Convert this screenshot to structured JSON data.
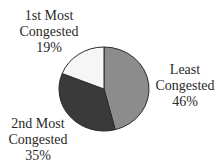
{
  "chart_data": {
    "type": "pie",
    "title": "",
    "categories": [
      "Least Congested",
      "2nd Most Congested",
      "1st Most Congested"
    ],
    "values": [
      46,
      35,
      19
    ],
    "unit": "%",
    "colors": [
      "#8c8c8c",
      "#3a3a3a",
      "#f6f6f6"
    ],
    "labels": [
      {
        "line1": "Least",
        "line2": "Congested",
        "value": "46%"
      },
      {
        "line1": "2nd Most",
        "line2": "Congested",
        "value": "35%"
      },
      {
        "line1": "1st Most",
        "line2": "Congested",
        "value": "19%"
      }
    ],
    "legend": "none"
  }
}
